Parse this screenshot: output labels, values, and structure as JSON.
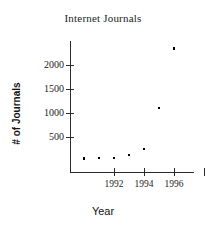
{
  "chart_data": {
    "type": "scatter",
    "title": "Internet Journals",
    "xlabel": "Year",
    "ylabel": "# of Journals",
    "x": [
      1990,
      1991,
      1992,
      1993,
      1994,
      1995,
      1996
    ],
    "values": [
      55,
      60,
      60,
      130,
      250,
      1100,
      2340
    ],
    "series": [
      {
        "name": "# of Journals",
        "values": [
          55,
          60,
          60,
          130,
          250,
          1100,
          2340
        ]
      }
    ],
    "xlim": [
      1989.4,
      1997.6
    ],
    "ylim": [
      0,
      2550
    ],
    "xticks": [
      1992,
      1994,
      1996
    ],
    "xtick_labels": [
      "1992",
      "1994",
      "1996"
    ],
    "yticks": [
      500,
      1000,
      1500,
      2000
    ],
    "ytick_labels": [
      "500",
      "1000",
      "1500",
      "2000"
    ],
    "grid": false,
    "legend": false,
    "marker": "point",
    "marker_color": "#000000",
    "axis_color": "#2b2b2b",
    "background": "#ffffff"
  }
}
